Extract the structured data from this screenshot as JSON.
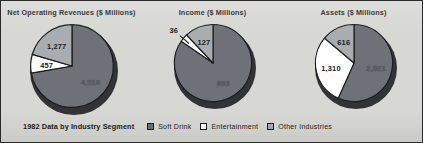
{
  "figure": {
    "background_color": "#d7d7d4",
    "border_color": "#2a2a2a"
  },
  "legend": {
    "caption": "1982 Data by Industry Segment",
    "items": [
      {
        "label": "Soft Drink",
        "color": "#6e7278",
        "swatch_name": "legend-swatch-soft-drink"
      },
      {
        "label": "Entertainment",
        "color": "#ffffff",
        "swatch_name": "legend-swatch-entertainment"
      },
      {
        "label": "Other Industries",
        "color": "#a9acb0",
        "swatch_name": "legend-swatch-other-industries"
      }
    ]
  },
  "chart_data": [
    {
      "type": "pie",
      "title": "Net Operating Revenues ($ Millions)",
      "categories": [
        "Soft Drink",
        "Entertainment",
        "Other Industries"
      ],
      "values": [
        4516,
        457,
        1277
      ],
      "labels": [
        "4,516",
        "457",
        "1,277"
      ],
      "colors": [
        "#6e7278",
        "#ffffff",
        "#a9acb0"
      ],
      "total": 6250,
      "start_angle_deg": 0,
      "direction": "clockwise",
      "legend_position": "bottom"
    },
    {
      "type": "pie",
      "title": "Income ($ Millions)",
      "categories": [
        "Soft Drink",
        "Entertainment",
        "Other Industries"
      ],
      "values": [
        893,
        36,
        127
      ],
      "labels": [
        "893",
        "36",
        "127"
      ],
      "colors": [
        "#6e7278",
        "#ffffff",
        "#a9acb0"
      ],
      "total": 1056,
      "start_angle_deg": 0,
      "direction": "clockwise",
      "legend_position": "bottom"
    },
    {
      "type": "pie",
      "title": "Assets ($ Millions)",
      "categories": [
        "Soft Drink",
        "Entertainment",
        "Other Industries"
      ],
      "values": [
        2521,
        1310,
        616
      ],
      "labels": [
        "2,521",
        "1,310",
        "616"
      ],
      "colors": [
        "#6e7278",
        "#ffffff",
        "#a9acb0"
      ],
      "total": 4447,
      "start_angle_deg": 0,
      "direction": "clockwise",
      "legend_position": "bottom"
    }
  ]
}
